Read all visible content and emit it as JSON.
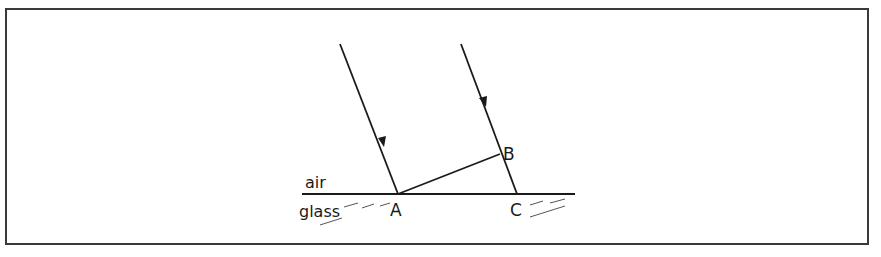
{
  "diagram": {
    "media": {
      "upper": "air",
      "lower": "glass"
    },
    "points": [
      {
        "label": "A",
        "x": 398,
        "y": 194
      },
      {
        "label": "B",
        "x": 500,
        "y": 154
      },
      {
        "label": "C",
        "x": 517,
        "y": 194
      }
    ],
    "rays": [
      {
        "name": "left-incident-ray",
        "from": [
          340,
          44
        ],
        "to": [
          398,
          194
        ]
      },
      {
        "name": "right-incident-ray",
        "from": [
          461,
          44
        ],
        "to": [
          517,
          194
        ]
      }
    ],
    "wavefront": {
      "from": "A",
      "to": "B"
    },
    "interface": {
      "x1": 302,
      "x2": 575,
      "y": 194
    },
    "colors": {
      "line": "#1a1a1a",
      "border": "#3a3a3a",
      "background": "#ffffff"
    }
  }
}
